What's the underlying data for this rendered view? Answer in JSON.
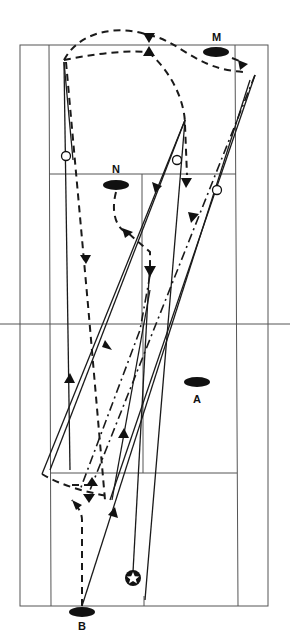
{
  "diagram": {
    "type": "badminton-court-rally-diagram",
    "players": [
      {
        "id": "M",
        "label": "M",
        "x": 216,
        "y": 52
      },
      {
        "id": "N",
        "label": "N",
        "x": 116,
        "y": 185
      },
      {
        "id": "A",
        "label": "A",
        "x": 197,
        "y": 382
      },
      {
        "id": "B",
        "label": "B",
        "x": 82,
        "y": 612
      }
    ],
    "start_marker": {
      "icon": "star-icon",
      "x": 133,
      "y": 578
    },
    "colors": {
      "ink": "#111111",
      "court_lines": "#555555",
      "background": "#ffffff"
    }
  }
}
